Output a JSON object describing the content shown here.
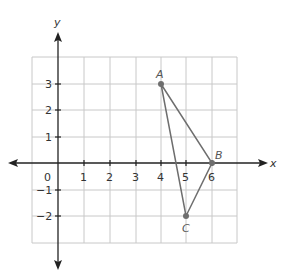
{
  "diagram": {
    "type": "coordinate-plane-triangle",
    "axes": {
      "x_label": "x",
      "y_label": "y",
      "origin_label": "0",
      "x_ticks": [
        "1",
        "2",
        "3",
        "4",
        "5",
        "6"
      ],
      "y_ticks_positive": [
        "1",
        "2",
        "3"
      ],
      "y_ticks_negative": [
        "−1",
        "−2"
      ]
    },
    "grid": {
      "x_min": -1,
      "x_max": 7,
      "y_min": -3,
      "y_max": 4
    },
    "points": [
      {
        "label": "A",
        "x": 4,
        "y": 3
      },
      {
        "label": "B",
        "x": 6,
        "y": 0
      },
      {
        "label": "C",
        "x": 5,
        "y": -2
      }
    ],
    "colors": {
      "grid": "#c8c8c8",
      "axis": "#222222",
      "triangle": "#6e6e6e",
      "point": "#6e6e6e"
    }
  }
}
